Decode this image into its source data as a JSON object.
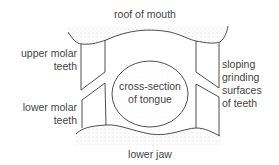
{
  "figure": {
    "labels": {
      "roof_of_mouth": "roof of mouth",
      "upper_molar_teeth": [
        "upper molar",
        "teeth"
      ],
      "lower_molar_teeth": [
        "lower molar",
        "teeth"
      ],
      "tongue": [
        "cross-section",
        "of tongue"
      ],
      "sloping_surfaces": [
        "sloping",
        "grinding",
        "surfaces",
        "of teeth"
      ],
      "lower_jaw": "lower jaw"
    },
    "colors": {
      "line": "#3a3a3a",
      "stipple": "#b8b8b8",
      "background": "#ffffff"
    }
  }
}
